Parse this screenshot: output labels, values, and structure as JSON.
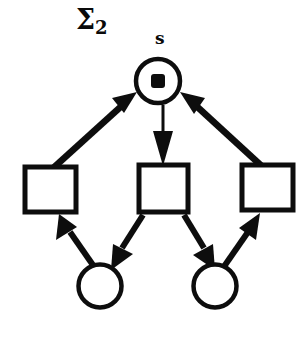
{
  "figure": {
    "kind": "petri-net-diagram",
    "title": "Σ",
    "title_subscript": "2",
    "ink_color": "#0d0d0d",
    "background_color": "#ffffff",
    "width": 308,
    "height": 347
  },
  "labels": [
    {
      "id": "sigma",
      "text": "Σ",
      "subscript": "2"
    },
    {
      "id": "place-s",
      "text": "s"
    }
  ],
  "places": [
    {
      "id": "s",
      "label": "s",
      "shape": "circle",
      "cx": 158,
      "cy": 81,
      "r": 23,
      "tokens": 1,
      "token_shape": "square-dot"
    },
    {
      "id": "p-left",
      "label": "",
      "shape": "circle",
      "cx": 100,
      "cy": 286,
      "r": 22,
      "tokens": 0,
      "token_shape": "none"
    },
    {
      "id": "p-right",
      "label": "",
      "shape": "circle",
      "cx": 215,
      "cy": 286,
      "r": 22,
      "tokens": 0,
      "token_shape": "none"
    }
  ],
  "transitions": [
    {
      "id": "t-left",
      "label": "",
      "shape": "rectangle",
      "x": 25,
      "y": 167,
      "width": 51,
      "height": 45
    },
    {
      "id": "t-middle",
      "label": "",
      "shape": "rectangle",
      "x": 139,
      "y": 165,
      "width": 49,
      "height": 47
    },
    {
      "id": "t-right",
      "label": "",
      "shape": "rectangle",
      "x": 242,
      "y": 165,
      "width": 51,
      "height": 45
    }
  ],
  "arcs": [
    {
      "id": "arc-tleft-to-s",
      "from": "t-left",
      "to": "s",
      "direction": "up-right"
    },
    {
      "id": "arc-tright-to-s",
      "from": "t-right",
      "to": "s",
      "direction": "up-left"
    },
    {
      "id": "arc-s-to-tmiddle",
      "from": "s",
      "to": "t-middle",
      "direction": "down"
    },
    {
      "id": "arc-pleft-to-tleft",
      "from": "p-left",
      "to": "t-left",
      "direction": "up-left"
    },
    {
      "id": "arc-tmiddle-to-pleft",
      "from": "t-middle",
      "to": "p-left",
      "direction": "down-left"
    },
    {
      "id": "arc-tmiddle-to-pright",
      "from": "t-middle",
      "to": "p-right",
      "direction": "down-right"
    },
    {
      "id": "arc-pright-to-tright",
      "from": "p-right",
      "to": "t-right",
      "direction": "up-right"
    }
  ]
}
